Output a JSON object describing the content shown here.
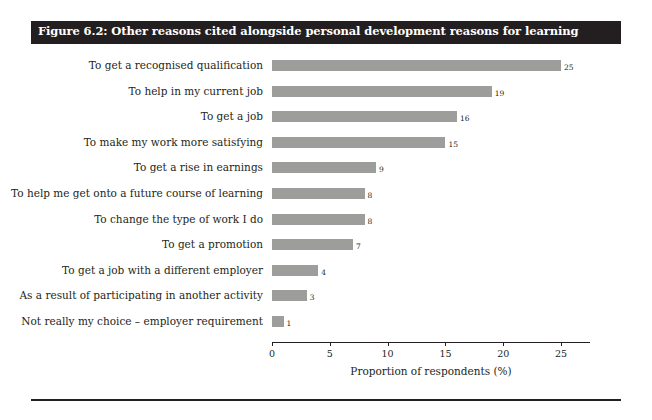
{
  "figure": {
    "title": "Figure 6.2: Other reasons cited alongside personal development reasons for learning"
  },
  "chart_data": {
    "type": "bar",
    "orientation": "horizontal",
    "title": "Figure 6.2: Other reasons cited alongside personal development reasons for learning",
    "xlabel": "Proportion of respondents (%)",
    "ylabel": "",
    "xlim": [
      0,
      27.5
    ],
    "xticks": [
      0,
      5,
      10,
      15,
      20,
      25
    ],
    "xticklabels": [
      "0",
      "5",
      "10",
      "15",
      "20",
      "25"
    ],
    "grid": false,
    "legend": false,
    "bar_color": "#9d9d9c",
    "categories": [
      "To get a recognised qualification",
      "To help in my current job",
      "To get a job",
      "To make my work more satisfying",
      "To get a rise in earnings",
      "To help me get onto a future course of learning",
      "To change the type of work I do",
      "To get a promotion",
      "To get a job with a different employer",
      "As a result of participating in another activity",
      "Not really my choice – employer requirement"
    ],
    "values": [
      25,
      19,
      16,
      15,
      9,
      8,
      8,
      7,
      4,
      3,
      1
    ],
    "value_labels": [
      "25",
      "19",
      "16",
      "15",
      "9",
      "8",
      "8",
      "7",
      "4",
      "3",
      "1"
    ]
  }
}
